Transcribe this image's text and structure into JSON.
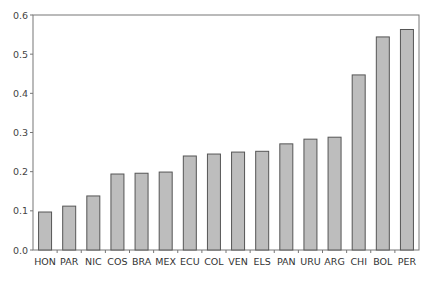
{
  "chart_data": {
    "type": "bar",
    "title": "",
    "xlabel": "",
    "ylabel": "",
    "ylim": [
      0,
      0.6
    ],
    "yticks": [
      0.0,
      0.1,
      0.2,
      0.3,
      0.4,
      0.5,
      0.6
    ],
    "ytick_labels": [
      "0.0",
      "0.1",
      "0.2",
      "0.3",
      "0.4",
      "0.5",
      "0.6"
    ],
    "grid": false,
    "legend": null,
    "categories": [
      "HON",
      "PAR",
      "NIC",
      "COS",
      "BRA",
      "MEX",
      "ECU",
      "COL",
      "VEN",
      "ELS",
      "PAN",
      "URU",
      "ARG",
      "CHI",
      "BOL",
      "PER"
    ],
    "values": [
      0.097,
      0.112,
      0.138,
      0.194,
      0.196,
      0.199,
      0.24,
      0.245,
      0.25,
      0.252,
      0.271,
      0.283,
      0.288,
      0.447,
      0.544,
      0.563
    ]
  },
  "style": {
    "bar_fill": "#bdbdbd",
    "bar_stroke": "#555555",
    "axis_color": "#777777"
  }
}
